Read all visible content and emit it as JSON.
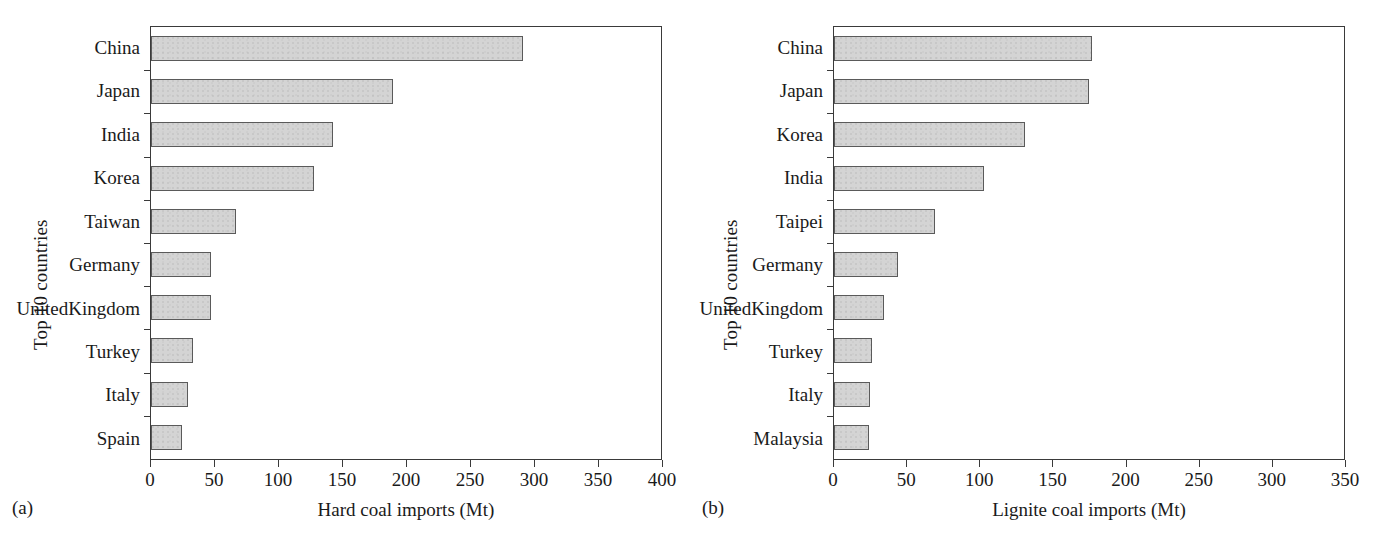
{
  "figure": {
    "panels": [
      {
        "tag": "(a)",
        "ylabel": "Top 10 countries",
        "xlabel": "Hard coal imports (Mt)"
      },
      {
        "tag": "(b)",
        "ylabel": "Top 10 countries",
        "xlabel": "Lignite coal imports (Mt)"
      }
    ]
  },
  "chart_data": [
    {
      "type": "bar",
      "orientation": "horizontal",
      "panel": "(a)",
      "title": "",
      "xlabel": "Hard coal imports (Mt)",
      "ylabel": "Top 10 countries",
      "xlim": [
        0,
        400
      ],
      "xticks": [
        0,
        50,
        100,
        150,
        200,
        250,
        300,
        350,
        400
      ],
      "xtick_labels": [
        "0",
        "50",
        "100",
        "150",
        "200",
        "250",
        "300",
        "350",
        "400"
      ],
      "grid": false,
      "legend": "none",
      "bar_fill": "#d4d4d4",
      "bar_edge": "#5a5a5a",
      "categories": [
        "China",
        "Japan",
        "India",
        "Korea",
        "Taiwan",
        "Germany",
        "United Kingdom",
        "Turkey",
        "Italy",
        "Spain"
      ],
      "values": [
        292,
        190,
        143,
        128,
        67,
        47,
        47,
        33,
        29,
        24
      ]
    },
    {
      "type": "bar",
      "orientation": "horizontal",
      "panel": "(b)",
      "title": "",
      "xlabel": "Lignite coal imports (Mt)",
      "ylabel": "Top 10 countries",
      "xlim": [
        0,
        350
      ],
      "xticks": [
        0,
        50,
        100,
        150,
        200,
        250,
        300,
        350
      ],
      "xtick_labels": [
        "0",
        "50",
        "100",
        "150",
        "200",
        "250",
        "300",
        "350"
      ],
      "grid": false,
      "legend": "none",
      "bar_fill": "#d4d4d4",
      "bar_edge": "#5a5a5a",
      "categories": [
        "China",
        "Japan",
        "Korea",
        "India",
        "Taipei",
        "Germany",
        "United Kingdom",
        "Turkey",
        "Italy",
        "Malaysia"
      ],
      "values": [
        177,
        175,
        131,
        103,
        69,
        44,
        34,
        26,
        25,
        24
      ]
    }
  ]
}
